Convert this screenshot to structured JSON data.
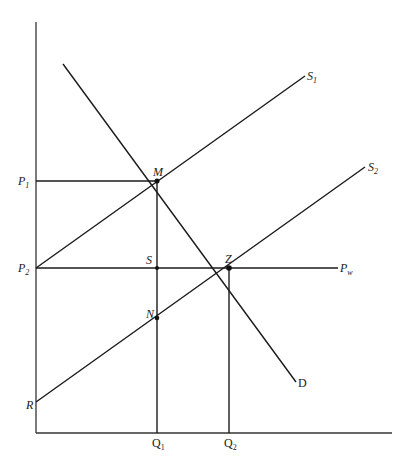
{
  "diagram": {
    "type": "supply-demand-trade",
    "axes": {
      "y_axis_label": "",
      "x_axis_label": ""
    },
    "curves": {
      "s1": {
        "label": "S",
        "sub": "1"
      },
      "s2": {
        "label": "S",
        "sub": "2"
      },
      "d": {
        "label": "D"
      },
      "pw": {
        "label": "P",
        "sub": "w"
      }
    },
    "price_labels": {
      "p1": {
        "label": "P",
        "sub": "1"
      },
      "p2": {
        "label": "P",
        "sub": "2"
      },
      "r": {
        "label": "R"
      }
    },
    "quantity_labels": {
      "q1": {
        "label": "Q",
        "sub": "1"
      },
      "q2": {
        "label": "Q",
        "sub": "2"
      }
    },
    "points": {
      "m": {
        "label": "M"
      },
      "s": {
        "label": "S"
      },
      "z": {
        "label": "Z"
      },
      "n": {
        "label": "N"
      }
    },
    "colors": {
      "line": "#1a1a1a",
      "background": "#ffffff"
    }
  }
}
